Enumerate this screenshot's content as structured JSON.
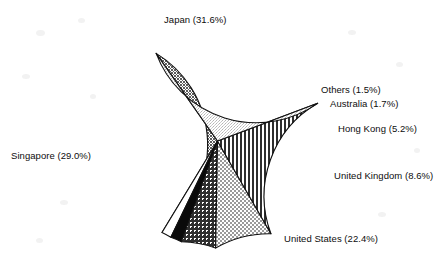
{
  "chart_data": {
    "type": "pie",
    "title": "",
    "subtitle": "",
    "xlabel": "",
    "ylabel": "",
    "legend_position": "none",
    "grid": false,
    "units": "percent",
    "label_format": "{name} ({value}%)",
    "start_angle_deg": 125,
    "direction": "clockwise",
    "categories": [
      "Japan",
      "Others",
      "Australia",
      "Hong Kong",
      "United Kingdom",
      "United States",
      "Singapore"
    ],
    "values": [
      31.6,
      1.5,
      1.7,
      5.2,
      8.6,
      22.4,
      29.0
    ],
    "slices": [
      {
        "name": "Japan",
        "value": 31.6,
        "label": "Japan (31.6%)",
        "pattern": "dense-gray-dither",
        "fill": "#7a7a7a",
        "start_deg": 125.0,
        "sweep_deg": 113.76
      },
      {
        "name": "Others",
        "value": 1.5,
        "label": "Others (1.5%)",
        "pattern": "solid-white",
        "fill": "#ffffff",
        "start_deg": 238.76,
        "sweep_deg": 5.4
      },
      {
        "name": "Australia",
        "value": 1.7,
        "label": "Australia (1.7%)",
        "pattern": "solid-black",
        "fill": "#000000",
        "start_deg": 244.16,
        "sweep_deg": 6.12
      },
      {
        "name": "Hong Kong",
        "value": 5.2,
        "label": "Hong Kong (5.2%)",
        "pattern": "dark-crosshatch-grid",
        "fill": "#444444",
        "start_deg": 250.28,
        "sweep_deg": 18.72
      },
      {
        "name": "United Kingdom",
        "value": 8.6,
        "label": "United Kingdom (8.6%)",
        "pattern": "light-checkerboard",
        "fill": "#c8c8c8",
        "start_deg": 269.0,
        "sweep_deg": 30.96
      },
      {
        "name": "United States",
        "value": 22.4,
        "label": "United States (22.4%)",
        "pattern": "vertical-stripes",
        "fill": "#a0a0a0",
        "start_deg": 299.96,
        "sweep_deg": 80.64
      },
      {
        "name": "Singapore",
        "value": 29.0,
        "label": "Singapore (29.0%)",
        "pattern": "very-light-dither",
        "fill": "#e8e8e8",
        "start_deg": 20.6,
        "sweep_deg": 104.4
      }
    ]
  },
  "labels": {
    "japan": "Japan (31.6%)",
    "others": "Others (1.5%)",
    "australia": "Australia (1.7%)",
    "hong_kong": "Hong Kong (5.2%)",
    "united_kingdom": "United Kingdom (8.6%)",
    "united_states": "United States (22.4%)",
    "singapore": "Singapore (29.0%)"
  },
  "colors": {
    "background": "#ffffff",
    "outline": "#111111",
    "text": "#0d0d0d"
  }
}
